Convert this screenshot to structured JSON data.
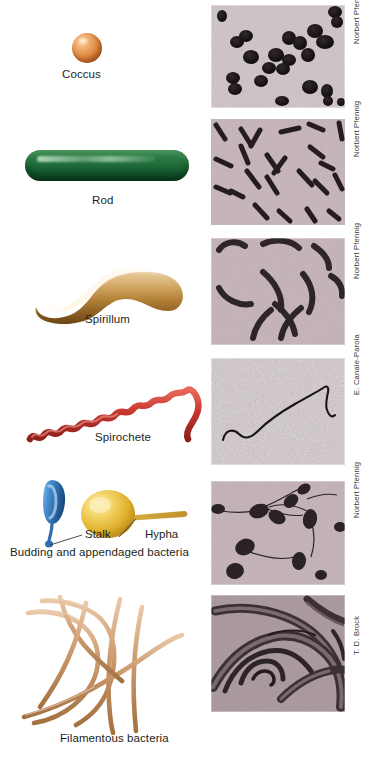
{
  "figure": {
    "background_color": "#ffffff",
    "text_color": "#231f20"
  },
  "rows": [
    {
      "id": "coccus",
      "caption": "Coccus",
      "shape_kind": "sphere",
      "illustration_color": "#e08a42",
      "credit": "Norbert Pfennig",
      "micrograph_description": "dark round cells scattered on light grey background"
    },
    {
      "id": "rod",
      "caption": "Rod",
      "shape_kind": "capsule",
      "illustration_color": "#1f6c39",
      "credit": "Norbert Pfennig",
      "micrograph_description": "dark short rod-shaped cells at random angles"
    },
    {
      "id": "spirillum",
      "caption": "Spirillum",
      "shape_kind": "curved-rod",
      "illustration_color": "#b8803a",
      "credit": "Norbert Pfennig",
      "micrograph_description": "curved comma-shaped cells clustered together"
    },
    {
      "id": "spirochete",
      "caption": "Spirochete",
      "shape_kind": "helix",
      "illustration_color": "#c8372f",
      "credit": "E. Canale-Parola",
      "micrograph_description": "single long thin wavy filament on speckled field"
    },
    {
      "id": "budding",
      "caption": "Budding and appendaged bacteria",
      "shape_kind": "budding",
      "illustration_color": "#2f6fae",
      "illustration_color_secondary": "#e8be3f",
      "credit": "Norbert Pfennig",
      "micrograph_description": "teardrop cells with thin stalks radiating outward",
      "annotations": [
        {
          "label": "Stalk"
        },
        {
          "label": "Hypha"
        }
      ]
    },
    {
      "id": "filamentous",
      "caption": "Filamentous bacteria",
      "shape_kind": "filaments",
      "illustration_color": "#c89a6e",
      "credit": "T. D. Brock",
      "micrograph_description": "long interwoven tubular filaments"
    }
  ]
}
